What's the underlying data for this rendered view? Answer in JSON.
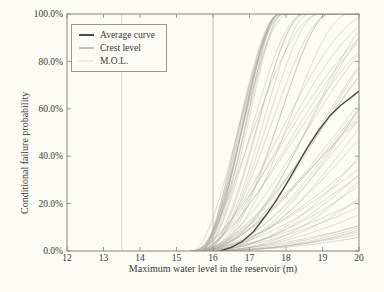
{
  "figure": {
    "background": "#fcfbf5"
  },
  "chart_data": {
    "type": "line",
    "title": "",
    "xlabel": "Maximum water level in the reservoir (m)",
    "ylabel": "Conditional failure probability",
    "xlim": [
      12,
      20
    ],
    "ylim": [
      0,
      100
    ],
    "x_ticks": [
      12,
      13,
      14,
      15,
      16,
      17,
      18,
      19,
      20
    ],
    "y_ticks": [
      0,
      20,
      40,
      60,
      80,
      100
    ],
    "y_tick_suffix": "%",
    "grid": false,
    "legend_position": "top-left",
    "axis_color": "#87857f",
    "text_color": "#3a3a36",
    "legend": [
      {
        "label": "Average curve",
        "color": "#4a4a48"
      },
      {
        "label": "Crest level",
        "color": "#c3c1ba"
      },
      {
        "label": "M.O.L.",
        "color": "#eceae3"
      }
    ],
    "reference_lines": [
      {
        "name": "M.O.L.",
        "x": 13.5,
        "color": "#d8d6cf"
      },
      {
        "name": "Crest level",
        "x": 16,
        "color": "#c3c1ba"
      }
    ],
    "average_curve": {
      "name": "Average curve",
      "color": "#4a4a48",
      "x": [
        16.2,
        16.5,
        16.8,
        17.1,
        17.4,
        17.7,
        18.0,
        18.3,
        18.6,
        18.9,
        19.2,
        19.5,
        19.8,
        20.0
      ],
      "y": [
        0,
        1.5,
        4,
        8,
        14,
        20.5,
        28,
        36,
        44,
        51,
        57,
        61.5,
        65,
        67.5
      ]
    },
    "ensemble": {
      "name": "Conditional failure probability curves",
      "count": 65,
      "seed": 11,
      "color": "#aeaca6",
      "opacity": 0.5,
      "x_onset": [
        15.35,
        15.75
      ],
      "x_saturation_min": 17.8,
      "x_saturation_span": 26
    }
  }
}
